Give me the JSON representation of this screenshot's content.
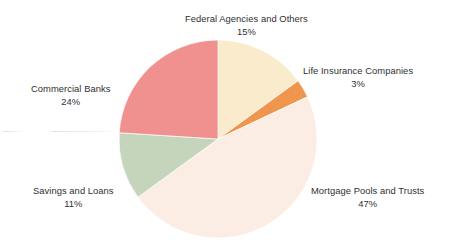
{
  "chart_data": {
    "type": "pie",
    "title": "",
    "subtitle": "",
    "xlabel": "",
    "ylabel": "",
    "legend_position": "none",
    "grid": false,
    "labels_outside": true,
    "units": "percent",
    "total": 100,
    "categories": [
      "Federal Agencies and Others",
      "Life Insurance Companies",
      "Mortgage Pools and Trusts",
      "Savings and Loans",
      "Commercial Banks"
    ],
    "values": [
      15,
      3,
      47,
      11,
      24
    ],
    "slices": [
      {
        "label": "Federal Agencies and Others",
        "value": 15,
        "value_text": "15%",
        "color": "#faebcd",
        "start_angle_deg": 0,
        "end_angle_deg": 54
      },
      {
        "label": "Life Insurance Companies",
        "value": 3,
        "value_text": "3%",
        "color": "#f0954e",
        "start_angle_deg": 54,
        "end_angle_deg": 64.8
      },
      {
        "label": "Mortgage Pools and Trusts",
        "value": 47,
        "value_text": "47%",
        "color": "#fbede3",
        "start_angle_deg": 64.8,
        "end_angle_deg": 234
      },
      {
        "label": "Savings and Loans",
        "value": 11,
        "value_text": "11%",
        "color": "#c5d5bc",
        "start_angle_deg": 234,
        "end_angle_deg": 273.6
      },
      {
        "label": "Commercial Banks",
        "value": 24,
        "value_text": "24%",
        "color": "#f0918f",
        "start_angle_deg": 273.6,
        "end_angle_deg": 360
      }
    ]
  },
  "labels": {
    "federal": {
      "name": "Federal Agencies and Others",
      "percent": "15%"
    },
    "life": {
      "name": "Life Insurance Companies",
      "percent": "3%"
    },
    "mortgage": {
      "name": "Mortgage Pools and Trusts",
      "percent": "47%"
    },
    "savings": {
      "name": "Savings and Loans",
      "percent": "11%"
    },
    "commercial": {
      "name": "Commercial Banks",
      "percent": "24%"
    }
  },
  "colors": {
    "background": "#ffffff",
    "text": "#2f2f33",
    "federal": "#faebcd",
    "life": "#f0954e",
    "mortgage": "#fbede3",
    "savings": "#c5d5bc",
    "commercial": "#f0918f"
  },
  "geometry": {
    "center_x": 218,
    "center_y": 139,
    "radius": 99
  }
}
